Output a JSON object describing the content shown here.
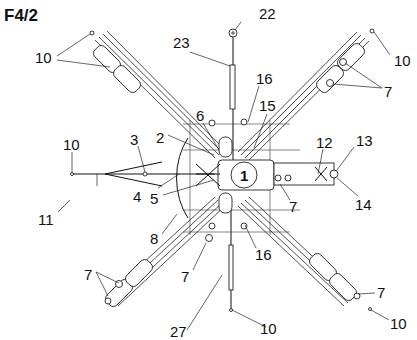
{
  "figure": {
    "title": "F4/2",
    "hub_label": "1",
    "callouts": [
      {
        "id": "c10-tl",
        "text": "10"
      },
      {
        "id": "c22",
        "text": "22"
      },
      {
        "id": "c10-tr",
        "text": "10"
      },
      {
        "id": "c23",
        "text": "23"
      },
      {
        "id": "c7-tr",
        "text": "7"
      },
      {
        "id": "c16-top",
        "text": "16"
      },
      {
        "id": "c6",
        "text": "6"
      },
      {
        "id": "c15",
        "text": "15"
      },
      {
        "id": "c10-l",
        "text": "10"
      },
      {
        "id": "c3",
        "text": "3"
      },
      {
        "id": "c2",
        "text": "2"
      },
      {
        "id": "c12",
        "text": "12"
      },
      {
        "id": "c13",
        "text": "13"
      },
      {
        "id": "c4",
        "text": "4"
      },
      {
        "id": "c5",
        "text": "5"
      },
      {
        "id": "c7-mid",
        "text": "7"
      },
      {
        "id": "c14",
        "text": "14"
      },
      {
        "id": "c11",
        "text": "11"
      },
      {
        "id": "c8",
        "text": "8"
      },
      {
        "id": "c7-bl",
        "text": "7"
      },
      {
        "id": "c7-b",
        "text": "7"
      },
      {
        "id": "c16-bot",
        "text": "16"
      },
      {
        "id": "c7-br",
        "text": "7"
      },
      {
        "id": "c27",
        "text": "27"
      },
      {
        "id": "c10-b",
        "text": "10"
      },
      {
        "id": "c10-br",
        "text": "10"
      }
    ]
  }
}
